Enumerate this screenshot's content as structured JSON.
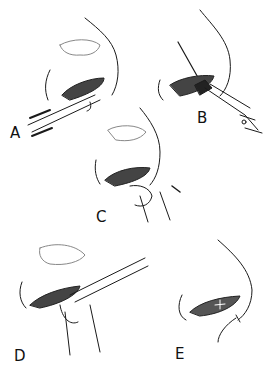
{
  "figure": {
    "type": "surgical line illustration",
    "panels": [
      {
        "id": "A",
        "label": "A",
        "description": "nasal vestibule with forceps inserted"
      },
      {
        "id": "B",
        "label": "B",
        "description": "incision with scissors and needle/suture"
      },
      {
        "id": "C",
        "label": "C",
        "description": "digital pressure on columella/ala with arrow"
      },
      {
        "id": "D",
        "label": "D",
        "description": "forceps and finger manipulating tissue"
      },
      {
        "id": "E",
        "label": "E",
        "description": "closed incision with sutures and arrow"
      }
    ],
    "colors": {
      "line": "#1a1a1a",
      "shade": "#555555",
      "background": "#ffffff"
    }
  }
}
